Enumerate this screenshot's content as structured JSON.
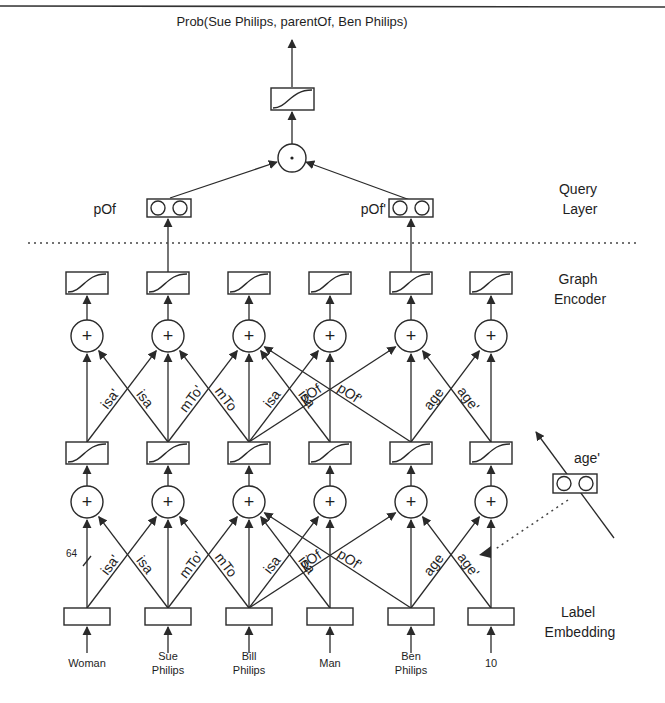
{
  "title": "Prob(Sue Philips, parentOf, Ben Philips)",
  "section_labels": {
    "query_layer": [
      "Query",
      "Layer"
    ],
    "graph_encoder": [
      "Graph",
      "Encoder"
    ],
    "label_embedding": [
      "Label",
      "Embedding"
    ]
  },
  "query": {
    "left_label": "pOf",
    "right_label": "pOf'",
    "combine_symbol": "·"
  },
  "dimension_annotation": "64",
  "nodes": [
    {
      "label_lines": [
        "Woman"
      ]
    },
    {
      "label_lines": [
        "Sue",
        "Philips"
      ]
    },
    {
      "label_lines": [
        "Bill",
        "Philips"
      ]
    },
    {
      "label_lines": [
        "Man"
      ]
    },
    {
      "label_lines": [
        "Ben",
        "Philips"
      ]
    },
    {
      "label_lines": [
        "10"
      ]
    }
  ],
  "edges": [
    {
      "from": 0,
      "to": 1,
      "label": "isa'"
    },
    {
      "from": 1,
      "to": 0,
      "label": "isa"
    },
    {
      "from": 1,
      "to": 2,
      "label": "mTo'"
    },
    {
      "from": 2,
      "to": 1,
      "label": "mTo"
    },
    {
      "from": 2,
      "to": 3,
      "label": "isa"
    },
    {
      "from": 3,
      "to": 2,
      "label": "isa"
    },
    {
      "from": 2,
      "to": 4,
      "label": "pOf"
    },
    {
      "from": 4,
      "to": 2,
      "label": "pOf'"
    },
    {
      "from": 4,
      "to": 5,
      "label": "age"
    },
    {
      "from": 5,
      "to": 4,
      "label": "age'"
    }
  ],
  "relation_inset": {
    "label": "age'"
  },
  "plus_symbol": "+"
}
